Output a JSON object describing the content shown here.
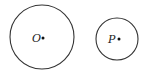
{
  "diagram": {
    "circles": [
      {
        "id": "circle-o",
        "center_label": "O"
      },
      {
        "id": "circle-p",
        "center_label": "P"
      }
    ],
    "colors": {
      "stroke": "#333333",
      "point": "#111111"
    }
  }
}
